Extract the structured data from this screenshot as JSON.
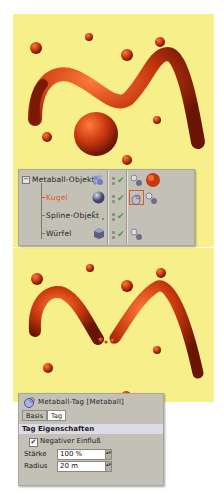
{
  "object_manager": {
    "rows": [
      {
        "name": "Metaball-Objekt",
        "icon": "metaball-icon",
        "tags": [
          "phong-tag-icon",
          "material-tag-icon"
        ],
        "visible": true,
        "selected": false
      },
      {
        "name": "Kugel",
        "icon": "sphere-icon",
        "tags": [
          "metaball-tag-icon",
          "phong-tag-icon"
        ],
        "visible": true,
        "selected": true
      },
      {
        "name": "Spline-Objekt",
        "icon": "spline-icon",
        "tags": [],
        "visible": true,
        "selected": false
      },
      {
        "name": "Würfel",
        "icon": "cube-icon",
        "tags": [
          "phong-tag-icon"
        ],
        "visible": true,
        "selected": false
      }
    ],
    "checkmark": "✔"
  },
  "attribute_manager": {
    "title": "Metaball-Tag [Metaball]",
    "tabs": [
      {
        "label": "Basis",
        "active": false
      },
      {
        "label": "Tag",
        "active": true
      }
    ],
    "section": "Tag Eigenschaften",
    "negative": {
      "label": "Negativer Einfluß",
      "checked": true,
      "mark": "✔"
    },
    "fields": [
      {
        "label": "Stärke",
        "value": "100 %"
      },
      {
        "label": "Radius",
        "value": "20 m"
      }
    ],
    "spinner": "▴▾"
  },
  "colors": {
    "viewport_bg": "#f7f08a",
    "metaball": "#c8380f",
    "panel_bg": "#c3c1b6",
    "selected_text": "#e0562a"
  }
}
